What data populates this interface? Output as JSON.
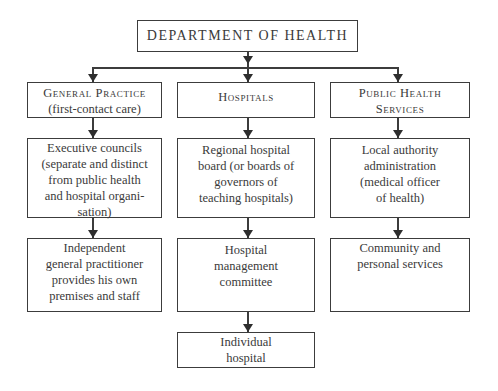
{
  "diagram": {
    "root": {
      "label": "DEPARTMENT OF HEALTH"
    },
    "columns": [
      {
        "header": {
          "title": "General Practice",
          "subtitle": "(first-contact care)"
        },
        "levels": [
          "Executive councils\n(separate and distinct\nfrom public health\nand hospital organi-\nsation)",
          "Independent\ngeneral practitioner\nprovides his own\npremises and staff"
        ]
      },
      {
        "header": {
          "title": "Hospitals"
        },
        "levels": [
          "Regional hospital\nboard (or boards of\ngovernors of\nteaching hospitals)",
          "Hospital\nmanagement\ncommittee",
          "Individual\nhospital"
        ]
      },
      {
        "header": {
          "title": "Public Health\nServices"
        },
        "levels": [
          "Local authority\nadministration\n(medical officer\nof health)",
          "Community and\npersonal services"
        ]
      }
    ],
    "colors": {
      "line": "#3c3c3c",
      "text": "#3a3a3a",
      "background": "#ffffff"
    }
  }
}
